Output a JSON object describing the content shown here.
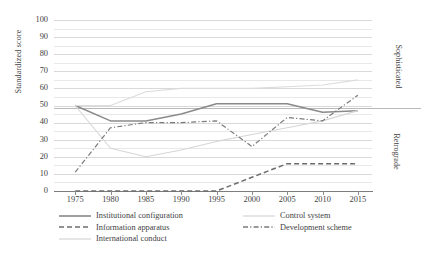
{
  "chart_data": {
    "type": "line",
    "title": "",
    "xlabel": "",
    "ylabel": "Standardized score",
    "x": [
      1975,
      1980,
      1985,
      1990,
      1995,
      2000,
      2005,
      2010,
      2015
    ],
    "xlim": [
      1972,
      2017
    ],
    "ylim": [
      0,
      100
    ],
    "ytick_labels": [
      "0",
      "10",
      "20",
      "30",
      "40",
      "50",
      "60",
      "70",
      "80",
      "90",
      "100"
    ],
    "ytick_values": [
      0,
      10,
      20,
      30,
      40,
      50,
      60,
      70,
      80,
      90,
      100
    ],
    "xtick_labels": [
      "1975",
      "1980",
      "1985",
      "1990",
      "1995",
      "2000",
      "2005",
      "2010",
      "2015"
    ],
    "grid": "horizontal major and minor (every 5)",
    "legend_position": "below plot, two columns",
    "band_labels": {
      "upper": "Sophisticated",
      "lower": "Retrograde",
      "divider_value": 52
    },
    "series": [
      {
        "name": "Institutional configuration",
        "style": "solid",
        "color": "#8a8a8a",
        "x": [
          1975,
          1980,
          1985,
          1990,
          1995,
          2000,
          2005,
          2010,
          2015
        ],
        "values": [
          50,
          41,
          41,
          45,
          51,
          51,
          51,
          46,
          47
        ]
      },
      {
        "name": "Information apparatus",
        "style": "dashed",
        "color": "#6d6d6d",
        "x": [
          1975,
          1980,
          1985,
          1990,
          1995,
          2000,
          2005,
          2010,
          2015
        ],
        "values": [
          0,
          0,
          0,
          0,
          0,
          8,
          16,
          16,
          16
        ]
      },
      {
        "name": "International conduct",
        "style": "solid-faint",
        "color": "#d6d6d6",
        "x": [
          1975,
          1980,
          1985,
          1990,
          1995,
          2000,
          2005,
          2010,
          2015
        ],
        "values": [
          50,
          25,
          20,
          24,
          29,
          33,
          37,
          41,
          47
        ]
      },
      {
        "name": "Control system",
        "style": "solid-faint",
        "color": "#dcdcdc",
        "x": [
          1975,
          1980,
          1985,
          1990,
          1995,
          2000,
          2005,
          2010,
          2015
        ],
        "values": [
          50,
          50,
          58,
          60,
          60,
          60,
          61,
          62,
          65
        ]
      },
      {
        "name": "Development scheme",
        "style": "dash-dot",
        "color": "#7a7a7a",
        "x": [
          1975,
          1980,
          1985,
          1990,
          1995,
          2000,
          2005,
          2010,
          2015
        ],
        "values": [
          11,
          37,
          40,
          40,
          41,
          26,
          43,
          41,
          56
        ]
      }
    ]
  },
  "legend": {
    "left_column": [
      {
        "label": "Institutional configuration",
        "swatch": "solid-line-swatch"
      },
      {
        "label": "Information apparatus",
        "swatch": "dashed-line-swatch"
      },
      {
        "label": "International conduct",
        "swatch": "faint-line-swatch"
      }
    ],
    "right_column": [
      {
        "label": "Control system",
        "swatch": "faint-line-swatch"
      },
      {
        "label": "Development scheme",
        "swatch": "dash-dot-line-swatch"
      }
    ]
  }
}
